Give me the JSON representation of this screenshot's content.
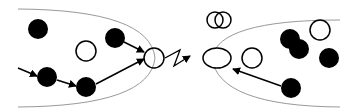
{
  "diagram": {
    "colors": {
      "filled": "#000000",
      "open_fill": "#ffffff",
      "stroke": "#000000",
      "boundary": "#999999"
    },
    "left_region": {
      "boundary": "M 18 9 Q 150 10 155 58 Q 150 106 18 107",
      "filled_circles": [
        {
          "id": "l-f1",
          "cx": 38,
          "cy": 29,
          "r": 10
        },
        {
          "id": "l-f2",
          "cx": 47,
          "cy": 77,
          "r": 10
        },
        {
          "id": "l-f3",
          "cx": 86,
          "cy": 87,
          "r": 10
        },
        {
          "id": "l-f4",
          "cx": 115,
          "cy": 38,
          "r": 10
        }
      ],
      "open_circles": [
        {
          "id": "l-o1",
          "cx": 86,
          "cy": 51,
          "r": 10
        },
        {
          "id": "l-o2",
          "cx": 154,
          "cy": 58,
          "r": 10
        }
      ],
      "arrows": [
        {
          "id": "a1",
          "x1": 18,
          "y1": 68,
          "x2": 37,
          "y2": 76
        },
        {
          "id": "a2",
          "x1": 57,
          "y1": 80,
          "x2": 76,
          "y2": 86
        },
        {
          "id": "a3",
          "x1": 96,
          "y1": 84,
          "x2": 144,
          "y2": 59
        },
        {
          "id": "a4",
          "x1": 124,
          "y1": 42,
          "x2": 144,
          "y2": 52
        }
      ]
    },
    "zigzag": {
      "points": "165,58 180,50 174,66 190,56",
      "arrow_tip": {
        "x": 192,
        "y": 55
      }
    },
    "right_region": {
      "boundary": "M 340 20 Q 218 20 212 58 Q 218 106 340 107",
      "ellipse": {
        "id": "r-e1",
        "cx": 217,
        "cy": 58,
        "rx": 14,
        "ry": 10
      },
      "overlap_circles": [
        {
          "id": "r-v1",
          "cx": 215,
          "cy": 20,
          "r": 8
        },
        {
          "id": "r-v2",
          "cx": 223,
          "cy": 20,
          "r": 8
        }
      ],
      "filled_circles": [
        {
          "id": "r-f1",
          "cx": 290,
          "cy": 39,
          "r": 10
        },
        {
          "id": "r-f2",
          "cx": 299,
          "cy": 49,
          "r": 10
        },
        {
          "id": "r-f3",
          "cx": 329,
          "cy": 58,
          "r": 10
        },
        {
          "id": "r-f4",
          "cx": 291,
          "cy": 88,
          "r": 10
        }
      ],
      "open_circles": [
        {
          "id": "r-o1",
          "cx": 252,
          "cy": 58,
          "r": 10
        },
        {
          "id": "r-o2",
          "cx": 320,
          "cy": 30,
          "r": 10
        }
      ],
      "arrows": [
        {
          "id": "a5",
          "x1": 281,
          "y1": 86,
          "x2": 233,
          "y2": 69
        }
      ]
    }
  }
}
